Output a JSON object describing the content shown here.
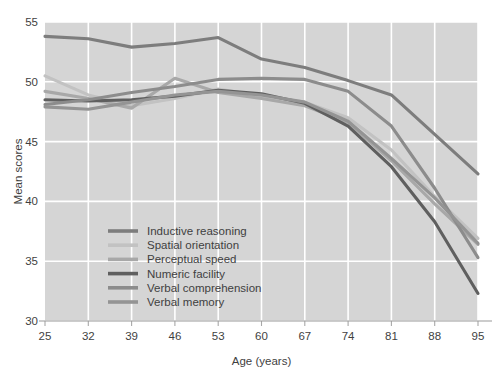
{
  "chart_data": {
    "type": "line",
    "title": "",
    "xlabel": "Age (years)",
    "ylabel": "Mean scores",
    "x": [
      25,
      32,
      39,
      46,
      53,
      60,
      67,
      74,
      81,
      88,
      95
    ],
    "xticklabels": [
      "25",
      "32",
      "39",
      "46",
      "53",
      "60",
      "67",
      "74",
      "81",
      "88",
      "95"
    ],
    "yticklabels": [
      "30",
      "35",
      "40",
      "45",
      "50",
      "55"
    ],
    "yticks": [
      30,
      35,
      40,
      45,
      50,
      55
    ],
    "xlim": [
      25,
      95
    ],
    "ylim": [
      30,
      55
    ],
    "grid": true,
    "legend_position": "lower-left-inside",
    "plot_background": "#d5d5d5",
    "gridline_color": "#ffffff",
    "series": [
      {
        "name": "Inductive reasoning",
        "color": "#7d7d7d",
        "values": [
          53.8,
          53.6,
          52.9,
          53.2,
          53.7,
          51.9,
          51.2,
          50.1,
          48.9,
          45.6,
          42.3
        ]
      },
      {
        "name": "Spatial orientation",
        "color": "#c2c2c2",
        "values": [
          50.5,
          48.9,
          48.0,
          48.6,
          49.4,
          48.8,
          48.3,
          47.0,
          44.3,
          40.4,
          36.9
        ]
      },
      {
        "name": "Perceptual speed",
        "color": "#a8a8a8",
        "values": [
          49.2,
          48.6,
          47.8,
          50.3,
          49.1,
          48.6,
          48.0,
          46.6,
          43.4,
          39.8,
          36.4
        ]
      },
      {
        "name": "Numeric facility",
        "color": "#5f5f5f",
        "values": [
          48.5,
          48.4,
          48.5,
          48.8,
          49.3,
          49.0,
          48.2,
          46.3,
          42.9,
          38.3,
          32.3
        ]
      },
      {
        "name": "Verbal comprehension",
        "color": "#8c8c8c",
        "values": [
          48.1,
          48.5,
          49.1,
          49.6,
          50.2,
          50.3,
          50.2,
          49.2,
          46.3,
          41.1,
          35.3
        ]
      },
      {
        "name": "Verbal memory",
        "color": "#949494",
        "values": [
          47.9,
          47.7,
          48.3,
          48.9,
          49.2,
          48.9,
          48.3,
          46.7,
          43.6,
          40.3,
          36.5
        ]
      }
    ]
  },
  "legend": {
    "items": [
      {
        "label": "Inductive reasoning"
      },
      {
        "label": "Spatial orientation"
      },
      {
        "label": "Perceptual speed"
      },
      {
        "label": "Numeric facility"
      },
      {
        "label": "Verbal comprehension"
      },
      {
        "label": "Verbal memory"
      }
    ]
  }
}
